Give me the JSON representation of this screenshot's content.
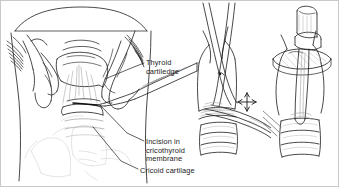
{
  "figure": {
    "style": "pen-and-ink medical line drawing",
    "background_color": "#ffffff",
    "ink_color": "#1b1b1b",
    "shade_color": "#9a9a9a",
    "ghost_color": "#d8d8d8"
  },
  "labels": {
    "thyroid": {
      "line1": "Thyroid",
      "line2": "cartiledge"
    },
    "incision": {
      "line1": "Incision in",
      "line2": "cricothyroid",
      "line3": "membrane"
    },
    "cricoid": {
      "line1": "Cricoid cartilage"
    }
  },
  "panels": [
    {
      "name": "panel-left",
      "caption": "Anterior neck with hands stabilizing larynx and scalpel making incision",
      "elements": [
        "patient-chin",
        "left-hand",
        "right-hand",
        "thyroid-cartilage",
        "cricothyroid-membrane",
        "cricoid-cartilage",
        "trachea",
        "scalpel",
        "ghosted-clavicles"
      ]
    },
    {
      "name": "panel-mid",
      "caption": "Close-up of larynx with hemostat spreading the incision",
      "elements": [
        "thyroid-cartilage",
        "cricoid-cartilage",
        "tracheal-rings",
        "hemostat",
        "scissors",
        "movement-arrow-cross"
      ]
    },
    {
      "name": "panel-right",
      "caption": "Tracheostomy tube seated in the airway",
      "elements": [
        "tracheostomy-tube",
        "tube-flange",
        "tube-connector",
        "tracheal-rings",
        "larynx"
      ]
    }
  ],
  "icons": {
    "movement_arrow": "four-way-arrow-cross"
  }
}
